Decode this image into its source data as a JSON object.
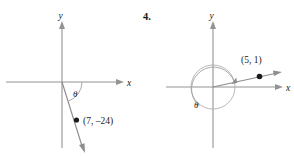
{
  "figure": {
    "problem_number": "4.",
    "panels": [
      {
        "id": "left-panel",
        "name": "angle-diagram-left",
        "x_axis_label": "x",
        "y_axis_label": "y",
        "angle_label": "θ",
        "point_label": "(7, –24)",
        "point_x": 7,
        "point_y": -24,
        "has_unit_circle": false,
        "rotation_direction": "clockwise"
      },
      {
        "id": "right-panel",
        "name": "angle-diagram-right",
        "x_axis_label": "x",
        "y_axis_label": "y",
        "angle_label": "θ",
        "point_label": "(5, 1)",
        "point_x": 5,
        "point_y": 1,
        "has_unit_circle": true,
        "rotation_direction": "counterclockwise"
      }
    ],
    "colors": {
      "background": "#ffffff",
      "axis": "#939393",
      "ray": "#8d8d8d",
      "arc": "#a0a0a0",
      "circle": "#b0b0b0",
      "point": "#1a1a1a",
      "text": "#1a1a1a"
    }
  }
}
